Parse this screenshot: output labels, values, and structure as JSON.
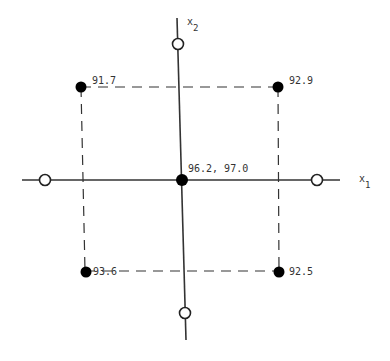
{
  "diagram": {
    "type": "central-composite-design",
    "axes": {
      "x1_label": "x",
      "x1_subscript": "1",
      "x2_label": "x",
      "x2_subscript": "2"
    },
    "points": {
      "center": {
        "label": "96.2, 97.0",
        "fill": "filled"
      },
      "top_left": {
        "label": "91.7",
        "fill": "filled"
      },
      "top_right": {
        "label": "92.9",
        "fill": "filled"
      },
      "bottom_left": {
        "label": "93.6",
        "fill": "filled"
      },
      "bottom_right": {
        "label": "92.5",
        "fill": "filled"
      },
      "axial_top": {
        "fill": "open"
      },
      "axial_bottom": {
        "fill": "open"
      },
      "axial_left": {
        "fill": "open"
      },
      "axial_right": {
        "fill": "open"
      }
    },
    "colors": {
      "line": "#333333",
      "point": "#000000",
      "background": "#ffffff"
    }
  }
}
